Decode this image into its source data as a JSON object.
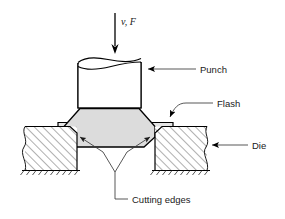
{
  "figure": {
    "background_color": "#ffffff",
    "line_color": "#000000",
    "workpiece_fill": "#dcdcdc",
    "flash_fill": "#e4e4e4",
    "punch_fill": "#ffffff",
    "die_fill": "#ffffff"
  },
  "labels": {
    "force": "v, F",
    "punch": "Punch",
    "flash": "Flash",
    "die": "Die",
    "cutting_edges": "Cutting edges"
  },
  "parts": [
    {
      "id": "punch",
      "name": "Punch",
      "fill": "#ffffff"
    },
    {
      "id": "workpiece",
      "name": "Workpiece",
      "fill": "#dcdcdc"
    },
    {
      "id": "flash-left",
      "name": "Flash (left)",
      "fill": "#e4e4e4"
    },
    {
      "id": "flash-right",
      "name": "Flash (right)",
      "fill": "#e4e4e4"
    },
    {
      "id": "die-left",
      "name": "Die (left half)",
      "fill": "#ffffff"
    },
    {
      "id": "die-right",
      "name": "Die (right half)",
      "fill": "#ffffff"
    },
    {
      "id": "cutting-edge-left",
      "name": "Cutting edge (left)"
    },
    {
      "id": "cutting-edge-right",
      "name": "Cutting edge (right)"
    }
  ],
  "annotations": [
    {
      "id": "force-arrow",
      "text": "v, F",
      "direction": "down",
      "target": "punch-top"
    },
    {
      "id": "punch-callout",
      "text": "Punch",
      "direction": "left",
      "target": "punch-body"
    },
    {
      "id": "flash-callout",
      "text": "Flash",
      "direction": "down-left",
      "target": "flash-right"
    },
    {
      "id": "die-callout",
      "text": "Die",
      "direction": "left",
      "target": "die-right"
    },
    {
      "id": "cutting-edges-callout",
      "text": "Cutting edges",
      "direction": "up",
      "target": "cutting-edges"
    }
  ]
}
